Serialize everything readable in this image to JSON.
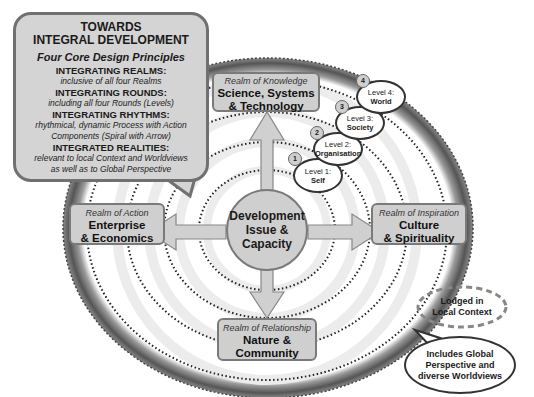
{
  "callout": {
    "title_line1": "TOWARDS",
    "title_line2": "INTEGRAL DEVELOPMENT",
    "subtitle": "Four Core Design Principles",
    "principles": [
      {
        "heading": "INTEGRATING REALMS:",
        "desc1": "inclusive of all four Realms",
        "desc2": ""
      },
      {
        "heading": "INTEGRATING ROUNDS:",
        "desc1": "including all four Rounds (Levels)",
        "desc2": ""
      },
      {
        "heading": "INTEGRATING RHYTHMS:",
        "desc1": "rhythmical, dynamic Process with Action",
        "desc2": "Components (Spiral with Arrow)"
      },
      {
        "heading": "INTEGRATED REALITIES:",
        "desc1": "relevant to local Context and Worldviews",
        "desc2": "as well as to Global Perspective"
      }
    ]
  },
  "center": {
    "line1": "Development",
    "line2": "Issue &",
    "line3": "Capacity"
  },
  "realms": {
    "knowledge": {
      "sub": "Realm of Knowledge",
      "line1": "Science, Systems",
      "line2": "& Technology"
    },
    "action": {
      "sub": "Realm of Action",
      "line1": "Enterprise",
      "line2": "& Economics"
    },
    "inspiration": {
      "sub": "Realm of Inspiration",
      "line1": "Culture",
      "line2": "& Spirituality"
    },
    "relationship": {
      "sub": "Realm of Relationship",
      "line1": "Nature &",
      "line2": "Community"
    }
  },
  "levels": [
    {
      "num": "1",
      "label": "Level 1:",
      "name": "Self"
    },
    {
      "num": "2",
      "label": "Level 2:",
      "name": "Organisation"
    },
    {
      "num": "3",
      "label": "Level 3:",
      "name": "Society"
    },
    {
      "num": "4",
      "label": "Level 4:",
      "name": "World"
    }
  ],
  "local_context": {
    "line1": "Lodged in",
    "line2": "Local Context"
  },
  "global": {
    "line1": "Includes Global",
    "line2": "Perspective and",
    "line3": "diverse Worldviews"
  },
  "colors": {
    "box_fill": "#cfcfcf",
    "box_border": "#7a7a7a",
    "earth_ring": "#6a6a6a",
    "background": "#ffffff"
  }
}
